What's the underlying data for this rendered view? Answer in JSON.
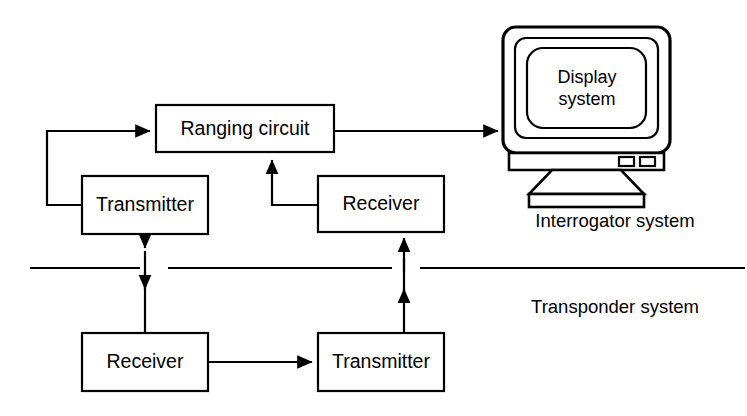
{
  "diagram": {
    "stroke_color": "#000000",
    "background_color": "#ffffff",
    "blocks": [
      {
        "id": "ranging_circuit",
        "label": "Ranging circuit",
        "x": 156,
        "y": 105,
        "w": 178,
        "h": 47
      },
      {
        "id": "interrogator_transmitter",
        "label": "Transmitter",
        "x": 82,
        "y": 176,
        "w": 126,
        "h": 58
      },
      {
        "id": "interrogator_receiver",
        "label": "Receiver",
        "x": 318,
        "y": 176,
        "w": 126,
        "h": 56
      },
      {
        "id": "transponder_receiver",
        "label": "Receiver",
        "x": 82,
        "y": 333,
        "w": 126,
        "h": 58
      },
      {
        "id": "transponder_transmitter",
        "label": "Transmitter",
        "x": 318,
        "y": 333,
        "w": 126,
        "h": 58
      }
    ],
    "display": {
      "screen_line_1": "Display",
      "screen_line_2": "system",
      "icon_name": "crt-monitor-icon"
    },
    "system_labels": [
      {
        "id": "interrogator",
        "label": "Interrogator system",
        "x": 615,
        "y": 222
      },
      {
        "id": "transponder",
        "label": "Transponder system",
        "x": 615,
        "y": 308
      }
    ],
    "separator": {
      "y": 268,
      "segments": [
        [
          30,
          140
        ],
        [
          168,
          392
        ],
        [
          420,
          745
        ]
      ]
    },
    "connections": [
      {
        "id": "ranging-to-display",
        "from": "ranging_circuit",
        "to": "display",
        "arrow": true
      },
      {
        "id": "transmitter-to-ranging",
        "from": "interrogator_transmitter",
        "to": "ranging_circuit",
        "arrow": true
      },
      {
        "id": "receiver-to-ranging",
        "from": "interrogator_receiver",
        "to": "ranging_circuit",
        "arrow": true
      },
      {
        "id": "transmitter-downlink",
        "from": "interrogator_transmitter",
        "to": "transponder_receiver",
        "arrow": true
      },
      {
        "id": "transponder-receiver-to-transmitter",
        "from": "transponder_receiver",
        "to": "transponder_transmitter",
        "arrow": true
      },
      {
        "id": "transponder-uplink",
        "from": "transponder_transmitter",
        "to": "interrogator_receiver",
        "arrow": true
      }
    ]
  }
}
